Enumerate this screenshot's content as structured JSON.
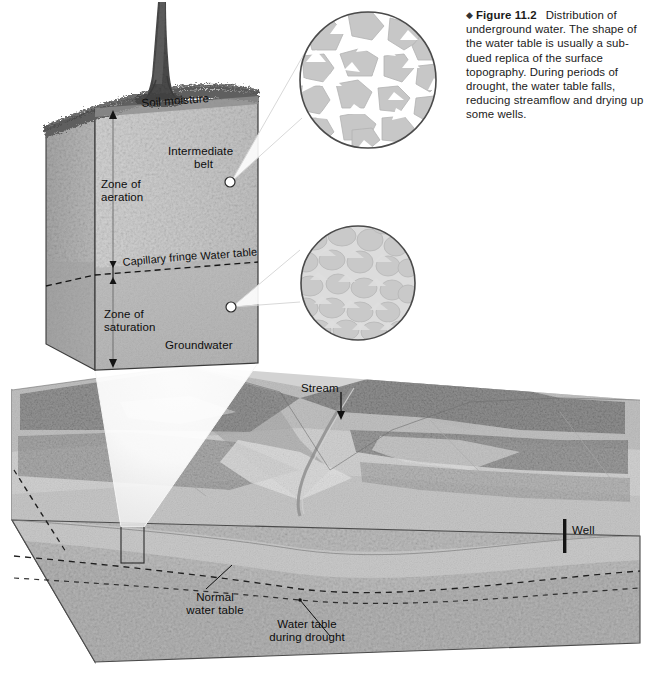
{
  "figure": {
    "bullet": "◆",
    "number": "Figure 11.2",
    "caption": "Distribution of underground water. The shape of the water table is usually a sub-dued replica of the surface topography. During periods of drought, the water table falls, reducing streamflow and drying up some wells.",
    "caption_lines": [
      "Distribution of",
      "underground water. The shape of",
      "the water table is usually a sub-",
      "dued replica of the surface",
      "topography. During periods of",
      "drought, the water table falls, re-",
      "ducing streamflow and drying up",
      "some wells."
    ]
  },
  "block": {
    "labels": {
      "soil_moisture": "Soil moisture",
      "intermediate_belt_line1": "Intermediate",
      "intermediate_belt_line2": "belt",
      "zone_of_aeration_line1": "Zone of",
      "zone_of_aeration_line2": "aeration",
      "capillary_fringe": "Capillary fringe",
      "water_table": "Water table",
      "zone_of_saturation_line1": "Zone of",
      "zone_of_saturation_line2": "saturation",
      "groundwater": "Groundwater"
    }
  },
  "insets": {
    "aeration": {
      "name": "zone-of-aeration-magnifier",
      "description": "grains with air-filled white pore spaces"
    },
    "saturation": {
      "name": "zone-of-saturation-magnifier",
      "description": "grains with water-filled gray pore spaces"
    }
  },
  "landscape": {
    "labels": {
      "stream": "Stream",
      "well": "Well",
      "normal_water_table_line1": "Normal",
      "normal_water_table_line2": "water table",
      "drought_water_table_line1": "Water table",
      "drought_water_table_line2": "during drought"
    }
  },
  "colors": {
    "page_background": "#ffffff",
    "block_front": "#cfcfcf",
    "block_side": "#b6b6b6",
    "block_top_soil": "#6a6a6a",
    "saturated_zone": "#b2b2b2",
    "grain_fill": "#c9c9c9",
    "grain_stroke": "#b0b0b0",
    "pore_air": "#ffffff",
    "pore_water": "#dcdcdc",
    "outline": "#3b3b3b",
    "dashed_line": "#1f1f1f",
    "text": "#0d0d0d",
    "terrain_light": "#d8d8d8",
    "terrain_mid": "#bdbdbd",
    "terrain_dark": "#9a9a9a",
    "forest": "#8a8a8a",
    "cone_highlight": "#ffffff"
  }
}
